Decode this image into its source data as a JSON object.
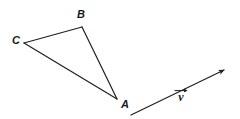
{
  "figure": {
    "type": "geometry-diagram",
    "background_color": "#ffffff",
    "stroke_color": "#1f1f1f",
    "stroke_width": 1.2,
    "canvas": {
      "width": 240,
      "height": 119
    },
    "triangle": {
      "name": "triangle-ABC",
      "vertices": [
        {
          "id": "A",
          "label": "A",
          "x": 117,
          "y": 99,
          "label_x": 121,
          "label_y": 99
        },
        {
          "id": "B",
          "label": "B",
          "x": 82,
          "y": 27,
          "label_x": 77,
          "label_y": 9
        },
        {
          "id": "C",
          "label": "C",
          "x": 24,
          "y": 43,
          "label_x": 12,
          "label_y": 35
        }
      ],
      "edges": [
        {
          "id": "CB",
          "from": "C",
          "to": "B"
        },
        {
          "id": "BA",
          "from": "B",
          "to": "A"
        },
        {
          "id": "CA",
          "from": "C",
          "to": "A"
        }
      ]
    },
    "vector": {
      "name": "vector-v",
      "label": "ν",
      "label_x": 174,
      "label_y": 88,
      "tail_x": 131,
      "tail_y": 115,
      "head_x": 226,
      "head_y": 69,
      "arrowhead": "filled-triangle"
    }
  }
}
